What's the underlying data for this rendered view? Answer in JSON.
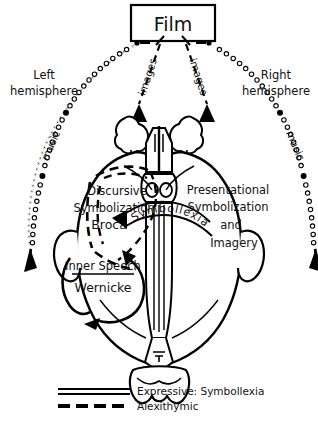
{
  "figure": {
    "title": "Film",
    "source_box_label": "Film",
    "hemispheres": {
      "left_line1": "Left",
      "left_line2": "hemisphere",
      "right_line1": "Right",
      "right_line2": "hemisphere"
    },
    "input_paths": [
      {
        "label": "music",
        "side": "left",
        "style": "beaded-chain"
      },
      {
        "label": "images",
        "side": "left",
        "style": "dashed-arrow"
      },
      {
        "label": "images",
        "side": "right",
        "style": "dashed-arrow"
      },
      {
        "label": "music",
        "side": "right",
        "style": "beaded-chain"
      }
    ],
    "left_region": {
      "line1": "Discursive",
      "line2": "Symbolization",
      "line3": "Broca"
    },
    "right_region": {
      "line1": "Presentational",
      "line2": "Symbolization",
      "line3": "and",
      "line4": "Imagery"
    },
    "center_banner": "Symbollexia",
    "lower_left_region": {
      "line1": "Inner Speech",
      "line2": "Wernicke"
    },
    "legend": [
      {
        "label": "Expressive: Symbollexia",
        "style": "double-solid"
      },
      {
        "label": "Alexithymic",
        "style": "thick-dashed"
      }
    ],
    "caption": "",
    "colors": {
      "ink": "#000000",
      "background": "#ffffff",
      "caption_gray": "#c9c9c9"
    }
  }
}
